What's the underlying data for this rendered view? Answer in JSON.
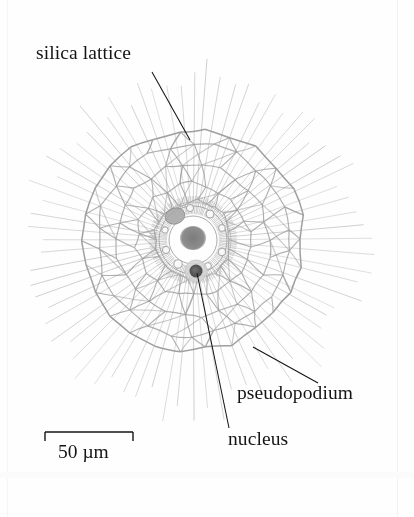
{
  "figure": {
    "background_color": "#fefefe",
    "width": 414,
    "height": 517,
    "ink_color": "#141414",
    "lattice_color": "#9a9a9a",
    "spine_color": "#b0b0b0",
    "nucleus_color": "#4a4a4a"
  },
  "organism": {
    "center_x": 193,
    "center_y": 240,
    "outer_lattice_radius": 110,
    "spine_radius": 166,
    "capsule_radius": 34,
    "shell_rings": [
      38,
      56,
      76,
      96,
      110
    ],
    "spine_count": 72,
    "sectors": 26,
    "central_mass": {
      "cx": 193,
      "cy": 238,
      "rx": 13,
      "ry": 12,
      "color": "#8d8d8d"
    },
    "nucleus_dot": {
      "cx": 196,
      "cy": 271,
      "r": 6.5,
      "color": "#4a4a4a",
      "halo_r": 11,
      "halo_color": "#c9c9c9"
    },
    "grey_blob": {
      "cx": 175,
      "cy": 216,
      "rx": 10,
      "ry": 8,
      "color": "#a6a6a6"
    },
    "vacuoles": [
      {
        "cx": 210,
        "cy": 214,
        "r": 4.0
      },
      {
        "cx": 222,
        "cy": 228,
        "r": 3.4
      },
      {
        "cx": 222,
        "cy": 252,
        "r": 3.8
      },
      {
        "cx": 208,
        "cy": 266,
        "r": 3.4
      },
      {
        "cx": 178,
        "cy": 264,
        "r": 4.2
      },
      {
        "cx": 166,
        "cy": 250,
        "r": 3.6
      },
      {
        "cx": 165,
        "cy": 230,
        "r": 3.2
      },
      {
        "cx": 190,
        "cy": 208,
        "r": 3.6
      }
    ]
  },
  "labels": {
    "silica_lattice": "silica lattice",
    "pseudopodium": "pseudopodium",
    "nucleus": "nucleus"
  },
  "leaders": [
    {
      "name": "silica-lattice-leader",
      "x1": 152,
      "y1": 72,
      "x2": 190,
      "y2": 140
    },
    {
      "name": "pseudopodium-leader",
      "x1": 318,
      "y1": 383,
      "x2": 253,
      "y2": 347
    },
    {
      "name": "nucleus-leader",
      "x1": 229,
      "y1": 428,
      "x2": 197,
      "y2": 273
    }
  ],
  "scalebar": {
    "label": "50 µm",
    "x1": 45,
    "x2": 133,
    "y": 432,
    "tick_height": 9,
    "line_color": "#141414"
  },
  "chart_data": {
    "type": "diagram",
    "annotations": [
      "silica lattice",
      "pseudopodium",
      "nucleus"
    ],
    "scale": {
      "length_px": 88,
      "label": "50 µm",
      "value": 50,
      "unit": "µm"
    }
  }
}
